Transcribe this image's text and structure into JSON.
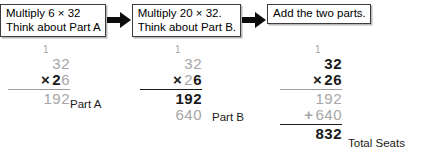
{
  "flow": {
    "steps": [
      {
        "line1": "Multiply 6 × 32",
        "line2": "Think about Part A"
      },
      {
        "line1": "Multiply 20 × 32.",
        "line2": "Think about Part B."
      },
      {
        "line1": "Add the two parts.",
        "line2": ""
      }
    ],
    "arrow_icon": "right-arrow-icon"
  },
  "columns": [
    {
      "name": "part-a",
      "carry": "1",
      "multiplicand": "32",
      "operator": "×",
      "multiplier_tens": "2",
      "multiplier_ones": "6",
      "partial1": "192",
      "partial2_sign": "",
      "partial2": "",
      "total": "",
      "caption": "Part A"
    },
    {
      "name": "part-b",
      "carry": "1",
      "multiplicand": "32",
      "operator": "×",
      "multiplier_tens": "2",
      "multiplier_ones": "6",
      "partial1": "192",
      "partial2_sign": "",
      "partial2": "640",
      "total": "",
      "caption": "Part B"
    },
    {
      "name": "total",
      "carry": "1",
      "multiplicand": "32",
      "operator": "×",
      "multiplier_tens": "2",
      "multiplier_ones": "6",
      "partial1": "192",
      "partial2_sign": "+",
      "partial2": "640",
      "total": "832",
      "caption": "Total Seats"
    }
  ],
  "colors": {
    "ink": "#1a1a1a",
    "faded": "#a6a6a6",
    "box_border": "#3c3c3c",
    "box_shadow": "#b9b9b9",
    "page": "#ffffff"
  }
}
